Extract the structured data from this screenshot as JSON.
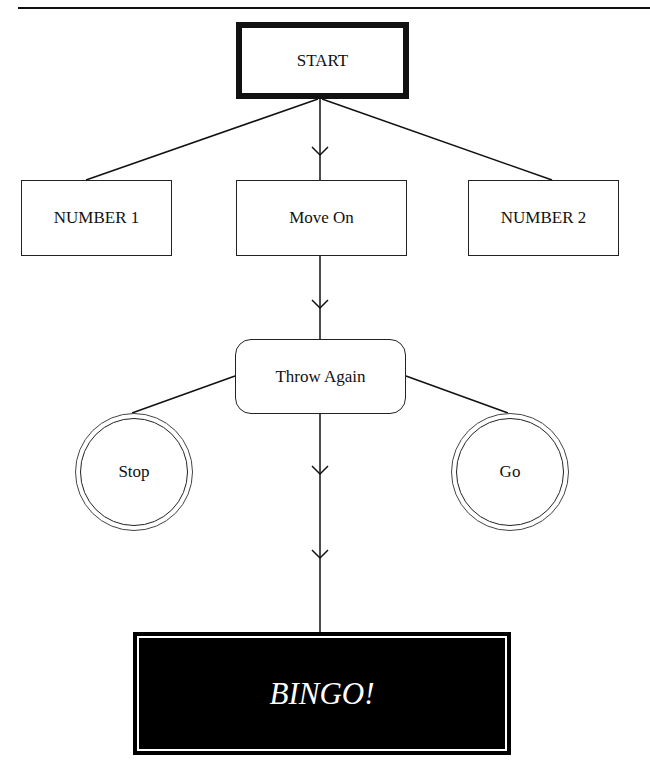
{
  "diagram": {
    "start": {
      "label": "START"
    },
    "level1": [
      {
        "label": "NUMBER 1"
      },
      {
        "label": "Move On"
      },
      {
        "label": "NUMBER 2"
      }
    ],
    "decision": {
      "label": "Throw Again"
    },
    "outcomes": [
      {
        "label": "Stop"
      },
      {
        "label": "Go"
      }
    ],
    "end": {
      "label": "BINGO!"
    },
    "edges": [
      {
        "from": "START",
        "to": "NUMBER 1"
      },
      {
        "from": "START",
        "to": "Move On",
        "arrow": true
      },
      {
        "from": "START",
        "to": "NUMBER 2"
      },
      {
        "from": "Move On",
        "to": "Throw Again",
        "arrow": true
      },
      {
        "from": "Throw Again",
        "to": "Stop"
      },
      {
        "from": "Throw Again",
        "to": "Go"
      },
      {
        "from": "Throw Again",
        "to": "BINGO!",
        "arrow": true
      }
    ]
  },
  "colors": {
    "line": "#111111",
    "end_fill": "#000000",
    "end_text": "#ffffff"
  }
}
